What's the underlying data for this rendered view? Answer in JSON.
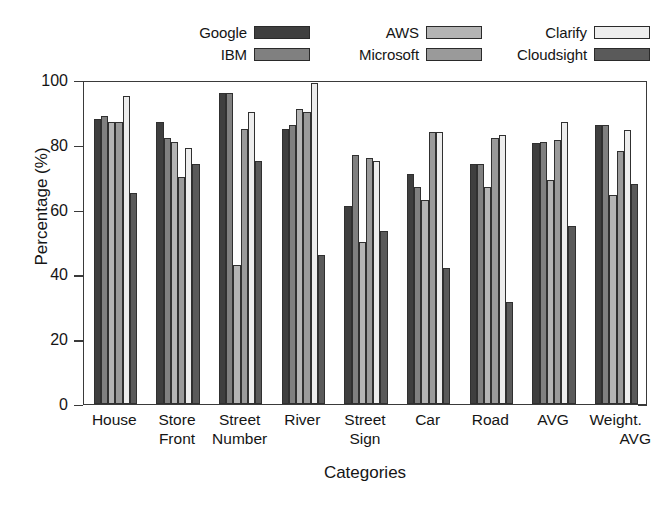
{
  "chart_data": {
    "type": "bar",
    "title": "",
    "xlabel": "Categories",
    "ylabel": "Percentage (%)",
    "ylim": [
      0,
      100
    ],
    "yticks": [
      0,
      20,
      40,
      60,
      80,
      100
    ],
    "grid": false,
    "legend_position": "top",
    "categories": [
      "House",
      "Store Front",
      "Street Number",
      "River",
      "Street Sign",
      "Car",
      "Road",
      "AVG",
      "Weight. AVG"
    ],
    "category_lines": [
      [
        "House",
        ""
      ],
      [
        "Store",
        "Front"
      ],
      [
        "Street",
        "Number"
      ],
      [
        "River",
        ""
      ],
      [
        "Street",
        "Sign"
      ],
      [
        "Car",
        ""
      ],
      [
        "Road",
        ""
      ],
      [
        "AVG",
        ""
      ],
      [
        "Weight.",
        "AVG"
      ]
    ],
    "series": [
      {
        "name": "Google",
        "color": "#3f3f3f",
        "values": [
          88,
          87,
          96,
          85,
          61,
          71,
          74,
          80.5,
          86
        ]
      },
      {
        "name": "IBM",
        "color": "#808080",
        "values": [
          89,
          82,
          96,
          86,
          77,
          67,
          74,
          81,
          86
        ]
      },
      {
        "name": "AWS",
        "color": "#b4b4b4",
        "values": [
          87,
          81,
          43,
          91,
          50,
          63,
          67,
          69,
          64.5
        ]
      },
      {
        "name": "Microsoft",
        "color": "#9a9a9a",
        "values": [
          87,
          70,
          85,
          90,
          76,
          84,
          82,
          81.5,
          78
        ]
      },
      {
        "name": "Clarify",
        "color": "#ededed",
        "values": [
          95,
          79,
          90,
          99,
          75,
          84,
          83,
          87,
          84.5
        ]
      },
      {
        "name": "Cloudsight",
        "color": "#5a5a5a",
        "values": [
          65,
          74,
          75,
          46,
          53.5,
          42,
          31.5,
          55,
          68
        ]
      }
    ]
  }
}
